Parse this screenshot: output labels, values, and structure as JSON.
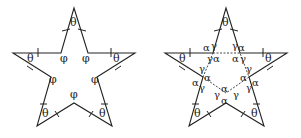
{
  "figures": [
    {
      "name": "star-left",
      "tip_angle_label": "θ",
      "inner_angle_label": "φ",
      "tip_count": 5,
      "inner_vertex_count": 5
    },
    {
      "name": "star-right",
      "tip_angle_label": "θ",
      "inner_angle_labels": [
        "α",
        "γ"
      ],
      "tip_count": 5,
      "inner_pentagon_dashed": true
    }
  ],
  "labels": {
    "theta": "θ",
    "phi": "φ",
    "alpha": "α",
    "gamma": "γ"
  }
}
